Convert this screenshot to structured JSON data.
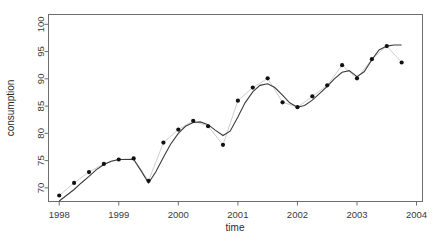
{
  "chart_data": {
    "type": "scatter",
    "title": "",
    "subtitle": "",
    "xlabel": "time",
    "ylabel": "consumption",
    "xlim": [
      1997.82,
      2004.1
    ],
    "ylim": [
      67.5,
      101.8
    ],
    "xticks": [
      1998,
      1999,
      2000,
      2001,
      2002,
      2003,
      2004
    ],
    "xtick_labels": [
      "1998",
      "1999",
      "2000",
      "2001",
      "2002",
      "2003",
      "2004"
    ],
    "yticks": [
      70,
      75,
      80,
      85,
      90,
      95,
      100
    ],
    "ytick_labels": [
      "70",
      "75",
      "80",
      "85",
      "90",
      "95",
      "100"
    ],
    "grid": false,
    "legend": null,
    "point_color": "#111111",
    "connector_color": "#c8c8c8",
    "trend_color": "#3c3c3c",
    "x": [
      1998.0,
      1998.25,
      1998.5,
      1998.75,
      1999.0,
      1999.25,
      1999.5,
      1999.75,
      2000.0,
      2000.25,
      2000.5,
      2000.75,
      2001.0,
      2001.25,
      2001.5,
      2001.75,
      2002.0,
      2002.25,
      2002.5,
      2002.75,
      2003.0,
      2003.25,
      2003.5,
      2003.75
    ],
    "values": [
      68.6,
      70.9,
      72.9,
      74.4,
      75.2,
      75.4,
      71.3,
      78.3,
      80.7,
      82.3,
      81.3,
      77.9,
      86.0,
      88.4,
      90.1,
      85.7,
      84.8,
      86.8,
      88.8,
      92.5,
      90.1,
      93.6,
      96.0,
      93.0
    ],
    "series": [
      {
        "name": "observed",
        "style": "points-with-connector",
        "values": [
          68.6,
          70.9,
          72.9,
          74.4,
          75.2,
          75.4,
          71.3,
          78.3,
          80.7,
          82.3,
          81.3,
          77.9,
          86.0,
          88.4,
          90.1,
          85.7,
          84.8,
          86.8,
          88.8,
          92.5,
          90.1,
          93.6,
          96.0,
          93.0
        ]
      },
      {
        "name": "smooth-trend",
        "style": "line",
        "x": [
          1998.0,
          1998.12,
          1998.25,
          1998.37,
          1998.5,
          1998.62,
          1998.75,
          1998.87,
          1999.0,
          1999.12,
          1999.25,
          1999.37,
          1999.5,
          1999.62,
          1999.75,
          1999.87,
          2000.0,
          2000.12,
          2000.25,
          2000.37,
          2000.5,
          2000.62,
          2000.75,
          2000.87,
          2001.0,
          2001.12,
          2001.25,
          2001.37,
          2001.5,
          2001.62,
          2001.75,
          2001.87,
          2002.0,
          2002.12,
          2002.25,
          2002.37,
          2002.5,
          2002.62,
          2002.75,
          2002.87,
          2003.0,
          2003.12,
          2003.25,
          2003.37,
          2003.5,
          2003.62,
          2003.75
        ],
        "values": [
          67.6,
          68.6,
          69.7,
          70.9,
          72.1,
          73.3,
          74.3,
          74.9,
          75.2,
          75.2,
          75.2,
          73.2,
          70.9,
          72.9,
          75.6,
          78.0,
          80.0,
          81.3,
          82.0,
          82.1,
          81.6,
          80.6,
          79.6,
          80.4,
          83.0,
          85.6,
          87.6,
          88.8,
          89.1,
          88.4,
          87.0,
          85.6,
          84.8,
          85.1,
          86.1,
          87.3,
          88.6,
          90.0,
          91.2,
          91.5,
          90.4,
          91.3,
          93.5,
          95.3,
          96.0,
          96.2,
          96.2
        ]
      }
    ]
  },
  "axis": {
    "x_title": "time",
    "y_title": "consumption"
  }
}
